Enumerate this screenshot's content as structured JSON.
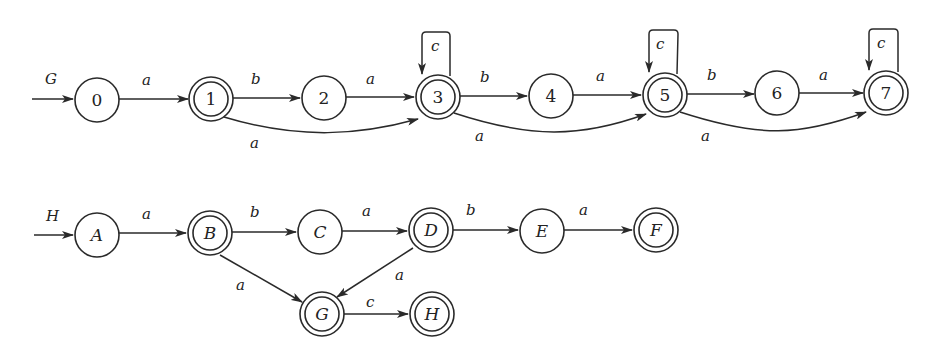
{
  "automata": [
    {
      "name": "G",
      "start_label": "G",
      "states": [
        {
          "id": "0",
          "label": "0",
          "accepting": false,
          "x": 97,
          "y": 100
        },
        {
          "id": "1",
          "label": "1",
          "accepting": true,
          "x": 211,
          "y": 99
        },
        {
          "id": "2",
          "label": "2",
          "accepting": false,
          "x": 324,
          "y": 98
        },
        {
          "id": "3",
          "label": "3",
          "accepting": true,
          "x": 438,
          "y": 97
        },
        {
          "id": "4",
          "label": "4",
          "accepting": false,
          "x": 551,
          "y": 96
        },
        {
          "id": "5",
          "label": "5",
          "accepting": true,
          "x": 665,
          "y": 95
        },
        {
          "id": "6",
          "label": "6",
          "accepting": false,
          "x": 777,
          "y": 93
        },
        {
          "id": "7",
          "label": "7",
          "accepting": true,
          "x": 886,
          "y": 93
        }
      ],
      "transitions": [
        {
          "from": "0",
          "to": "1",
          "symbol": "a"
        },
        {
          "from": "1",
          "to": "2",
          "symbol": "b"
        },
        {
          "from": "2",
          "to": "3",
          "symbol": "a"
        },
        {
          "from": "3",
          "to": "4",
          "symbol": "b"
        },
        {
          "from": "4",
          "to": "5",
          "symbol": "a"
        },
        {
          "from": "5",
          "to": "6",
          "symbol": "b"
        },
        {
          "from": "6",
          "to": "7",
          "symbol": "a"
        },
        {
          "from": "1",
          "to": "3",
          "symbol": "a"
        },
        {
          "from": "3",
          "to": "5",
          "symbol": "a"
        },
        {
          "from": "5",
          "to": "7",
          "symbol": "a"
        },
        {
          "from": "3",
          "to": "3",
          "symbol": "c"
        },
        {
          "from": "5",
          "to": "5",
          "symbol": "c"
        },
        {
          "from": "7",
          "to": "7",
          "symbol": "c"
        }
      ]
    },
    {
      "name": "H",
      "start_label": "H",
      "states": [
        {
          "id": "A",
          "label": "A",
          "accepting": false,
          "x": 97,
          "y": 235
        },
        {
          "id": "B",
          "label": "B",
          "accepting": true,
          "x": 210,
          "y": 233
        },
        {
          "id": "C",
          "label": "C",
          "accepting": false,
          "x": 320,
          "y": 232
        },
        {
          "id": "D",
          "label": "D",
          "accepting": true,
          "x": 431,
          "y": 230
        },
        {
          "id": "E",
          "label": "E",
          "accepting": false,
          "x": 542,
          "y": 231
        },
        {
          "id": "F",
          "label": "F",
          "accepting": true,
          "x": 656,
          "y": 230
        },
        {
          "id": "G",
          "label": "G",
          "accepting": true,
          "x": 322,
          "y": 314
        },
        {
          "id": "H",
          "label": "H",
          "accepting": true,
          "x": 432,
          "y": 314
        }
      ],
      "transitions": [
        {
          "from": "A",
          "to": "B",
          "symbol": "a"
        },
        {
          "from": "B",
          "to": "C",
          "symbol": "b"
        },
        {
          "from": "C",
          "to": "D",
          "symbol": "a"
        },
        {
          "from": "D",
          "to": "E",
          "symbol": "b"
        },
        {
          "from": "E",
          "to": "F",
          "symbol": "a"
        },
        {
          "from": "B",
          "to": "G",
          "symbol": "a"
        },
        {
          "from": "D",
          "to": "G",
          "symbol": "a"
        },
        {
          "from": "G",
          "to": "H",
          "symbol": "c"
        }
      ]
    }
  ]
}
